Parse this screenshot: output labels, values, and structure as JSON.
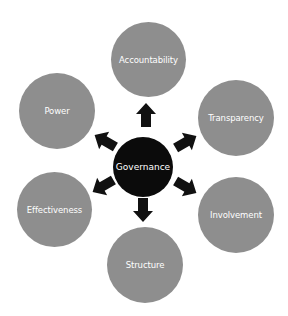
{
  "diagram": {
    "type": "hub-and-spoke",
    "center": {
      "label": "Governance",
      "color": "#0b0b0b",
      "text_color": "#ffffff"
    },
    "node_color": "#8e8e8e",
    "node_text_color": "#ffffff",
    "arrow_color": "#111111",
    "nodes": [
      {
        "label": "Accountability",
        "position": "top"
      },
      {
        "label": "Transparency",
        "position": "upper-right"
      },
      {
        "label": "Involvement",
        "position": "lower-right"
      },
      {
        "label": "Structure",
        "position": "bottom"
      },
      {
        "label": "Effectiveness",
        "position": "lower-left"
      },
      {
        "label": "Power",
        "position": "upper-left"
      }
    ]
  }
}
